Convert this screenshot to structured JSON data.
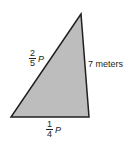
{
  "figure": {
    "shape": "triangle",
    "fill_color": "#bdbdbd",
    "stroke_color": "#231f20",
    "vertices": [
      [
        81,
        14
      ],
      [
        11,
        117
      ],
      [
        89,
        117
      ]
    ]
  },
  "labels": {
    "left_side": {
      "numerator": "2",
      "denominator": "5",
      "variable": "P"
    },
    "right_side": {
      "text": "7 meters"
    },
    "bottom_side": {
      "numerator": "1",
      "denominator": "4",
      "variable": "P"
    }
  }
}
